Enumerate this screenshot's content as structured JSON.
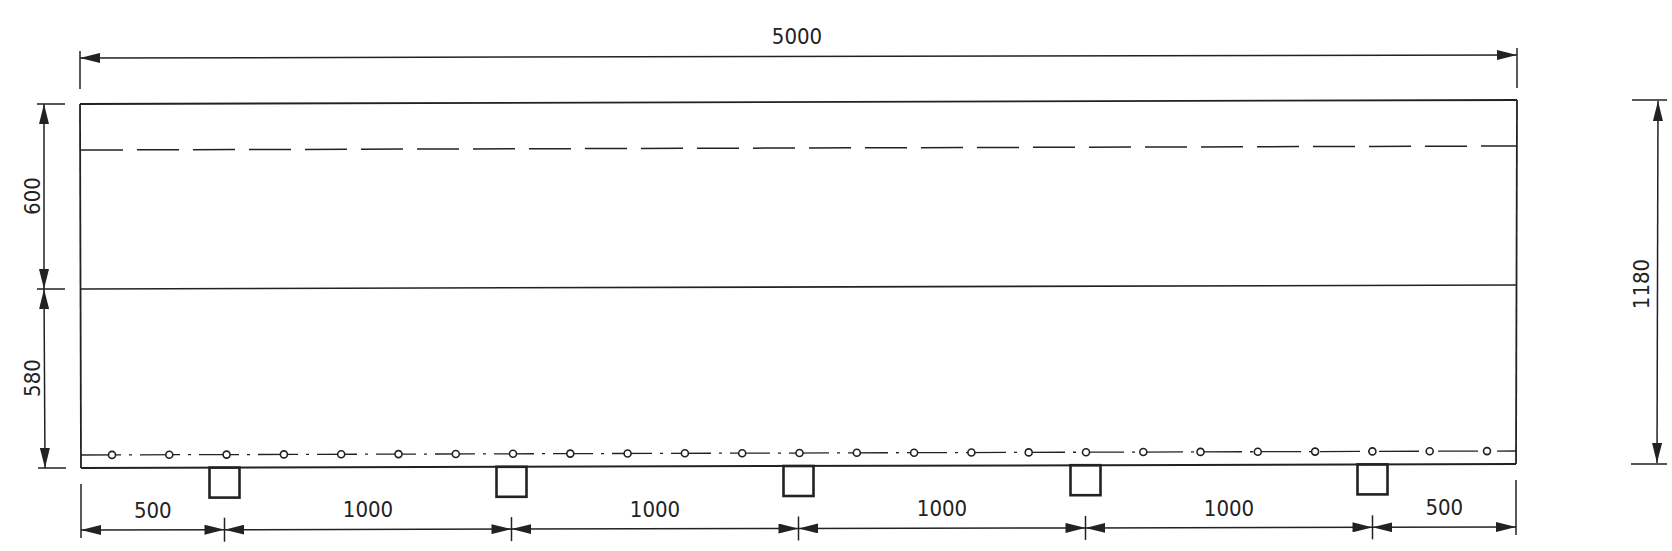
{
  "drawing": {
    "type": "technical-elevation",
    "units": "mm",
    "colors": {
      "ink": "#222222",
      "background": "#ffffff"
    },
    "overall_width_label": "5000",
    "overall_height_label": "1180",
    "left_dims": {
      "upper_label": "600",
      "lower_label": "580"
    },
    "bottom_dims": [
      {
        "label": "500"
      },
      {
        "label": "1000"
      },
      {
        "label": "1000"
      },
      {
        "label": "1000"
      },
      {
        "label": "1000"
      },
      {
        "label": "500"
      }
    ],
    "supports_count": 5,
    "rebar_points_count": 25,
    "lines": {
      "top_edge": "solid",
      "upper_hidden": "dashed",
      "mid_division": "solid",
      "reinforcement_axis": "dash-dot",
      "bottom_edge": "solid"
    }
  },
  "chart_data": {
    "type": "table",
    "overall_length": 5000,
    "overall_height": 1180,
    "height_segments": [
      600,
      580
    ],
    "support_spacing": [
      500,
      1000,
      1000,
      1000,
      1000,
      500
    ],
    "supports": 5,
    "rebar_circles": 25
  }
}
